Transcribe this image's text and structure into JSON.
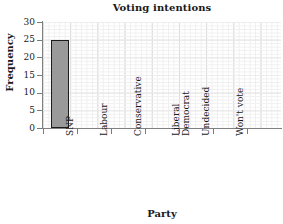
{
  "chart_data": {
    "type": "bar",
    "title": "Voting intentions",
    "xlabel": "Party",
    "ylabel": "Frequency",
    "categories": [
      "SNP",
      "Labour",
      "Conservative",
      "Liberal Democrat",
      "Undecided",
      "Won't vote"
    ],
    "category_lines": [
      [
        "SNP"
      ],
      [
        "Labour"
      ],
      [
        "Conservative"
      ],
      [
        "Liberal",
        "Democrat"
      ],
      [
        "Undecided"
      ],
      [
        "Won't vote"
      ]
    ],
    "values": [
      25,
      0,
      0,
      0,
      0,
      0
    ],
    "ylim": [
      0,
      30
    ],
    "ytick_labels": [
      "0",
      "5",
      "10",
      "15",
      "20",
      "25",
      "30"
    ],
    "ytick_values": [
      0,
      5,
      10,
      15,
      20,
      25,
      30
    ],
    "grid": true,
    "grid_style": "graph-paper minor and major gridlines",
    "legend": "none",
    "bar_fill_color": "#9a9a9a",
    "bar_edge_color": "#1c1c1c",
    "grid_minor_color": "#efefef",
    "grid_major_color": "#d9d9d9",
    "axis_color": "#808080",
    "background_color": "#ffffff"
  }
}
